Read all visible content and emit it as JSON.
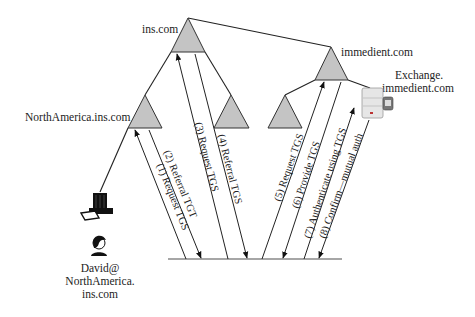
{
  "diagram": {
    "type": "kerberos-cross-realm-referral",
    "nodes": {
      "root": {
        "label": "ins.com"
      },
      "north_america": {
        "label": "NorthAmerica.ins.com"
      },
      "ins_child": {
        "label": ""
      },
      "immedient": {
        "label": "immedient.com"
      },
      "immedient_child": {
        "label": ""
      },
      "exchange_server": {
        "label_line1": "Exchange.",
        "label_line2": "immedient.com"
      },
      "client_pc": {
        "label": ""
      },
      "user": {
        "label_line1": "David@",
        "label_line2": "NorthAmerica.",
        "label_line3": "ins.com"
      }
    },
    "messages": [
      {
        "step": 1,
        "label": "(1) Request TGS",
        "direction": "up",
        "target": "NorthAmerica.ins.com"
      },
      {
        "step": 2,
        "label": "(2) Referral TGT",
        "direction": "down",
        "source": "NorthAmerica.ins.com"
      },
      {
        "step": 3,
        "label": "(3) Request TGS",
        "direction": "up",
        "target": "ins.com"
      },
      {
        "step": 4,
        "label": "(4) Referral TGS",
        "direction": "down",
        "source": "ins.com"
      },
      {
        "step": 5,
        "label": "(5) Request TGS",
        "direction": "up",
        "target": "immedient.com"
      },
      {
        "step": 6,
        "label": "(6) Provide TGS",
        "direction": "down",
        "source": "immedient.com"
      },
      {
        "step": 7,
        "label": "(7) Authenticate using TGS",
        "direction": "up",
        "target": "Exchange.immedient.com"
      },
      {
        "step": 8,
        "label": "(8) Confirm—mutual auth",
        "direction": "down",
        "source": "Exchange.immedient.com"
      }
    ],
    "colors": {
      "triangle_fill": "#c4c4c4",
      "line": "#222222",
      "baseline": "#888888"
    }
  }
}
